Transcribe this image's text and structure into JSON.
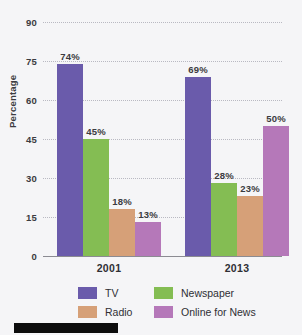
{
  "chart_data": {
    "type": "bar",
    "title": "",
    "xlabel": "",
    "ylabel": "Percentage",
    "categories": [
      "2001",
      "2013"
    ],
    "ylim": [
      0,
      90
    ],
    "yticks": [
      0,
      15,
      30,
      45,
      60,
      75,
      90
    ],
    "ytick_labels": [
      "0",
      "15",
      "30",
      "45",
      "60",
      "75",
      "90"
    ],
    "grid": true,
    "legend_position": "bottom",
    "value_suffix": "%",
    "series": [
      {
        "name": "TV",
        "color": "#6a5bab",
        "values": [
          74,
          69
        ],
        "labels": [
          "74%",
          "69%"
        ]
      },
      {
        "name": "Newspaper",
        "color": "#84bd53",
        "values": [
          45,
          28
        ],
        "labels": [
          "45%",
          "28%"
        ]
      },
      {
        "name": "Radio",
        "color": "#d6a078",
        "values": [
          18,
          23
        ],
        "labels": [
          "18%",
          "23%"
        ]
      },
      {
        "name": "Online for News",
        "color": "#b578b9",
        "values": [
          13,
          50
        ],
        "labels": [
          "13%",
          "50%"
        ]
      }
    ]
  }
}
